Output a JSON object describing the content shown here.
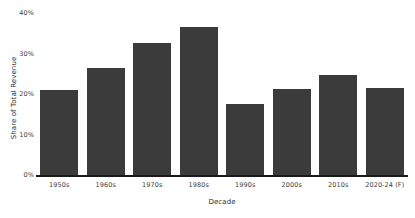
{
  "chart_data": {
    "type": "bar",
    "title": "",
    "subtitle": "",
    "xlabel": "Decade",
    "ylabel": "Share of Total Revenue",
    "categories": [
      "1950s",
      "1960s",
      "1970s",
      "1980s",
      "1990s",
      "2000s",
      "2010s",
      "2020-24 (F)"
    ],
    "values": [
      21.0,
      26.5,
      32.7,
      36.5,
      17.6,
      21.2,
      24.6,
      21.6
    ],
    "value_unit": "%",
    "ylim": [
      0,
      40
    ],
    "yticks": [
      0,
      10,
      20,
      30,
      40
    ],
    "ytick_labels": [
      "0%",
      "10%",
      "20%",
      "30%",
      "40%"
    ],
    "grid": false,
    "legend": null,
    "legend_position": "none",
    "bar_color": "#3b3b3b",
    "background_color": "#ffffff",
    "axis_color": "#1a1a1a",
    "annotations": []
  }
}
